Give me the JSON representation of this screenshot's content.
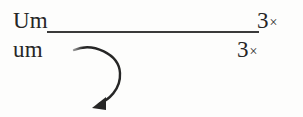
{
  "figure": {
    "background_color": "#fdfdfc",
    "ink_color": "#262626",
    "rule_color": "#3a3a3a",
    "rows": [
      {
        "word": "Um",
        "multiplier_number": "3",
        "multiplier_symbol": "×"
      },
      {
        "word": "um",
        "multiplier_number": "3",
        "multiplier_symbol": "×"
      }
    ],
    "annotation": {
      "arrow_name": "curved-clockwise-arrow",
      "arrow_direction": "clockwise-down-left",
      "arrow_color": "#262626"
    }
  }
}
